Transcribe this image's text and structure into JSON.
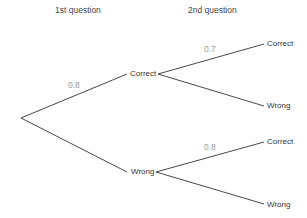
{
  "headers": {
    "first": "1st question",
    "second": "2nd question"
  },
  "nodes": {
    "q1_correct": "Correct",
    "q1_wrong": "Wrong",
    "q2_after_correct_correct": "Correct",
    "q2_after_correct_wrong": "Wrong",
    "q2_after_wrong_correct": "Correct",
    "q2_after_wrong_wrong": "Wrong"
  },
  "probabilities": {
    "q1_correct": "0.8",
    "q2_correct_given_correct": "0.7",
    "q2_correct_given_wrong": "0.8"
  },
  "colors": {
    "line": "#333333",
    "prob_text": "#999999"
  }
}
